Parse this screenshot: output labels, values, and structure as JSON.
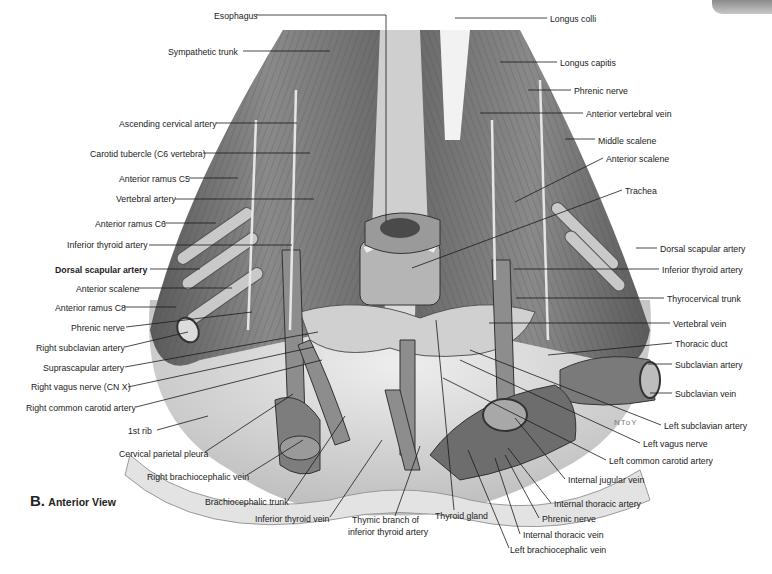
{
  "figure": {
    "panel_letter": "B.",
    "view_title": "Anterior View",
    "artist_signature": "NToY"
  },
  "labels_left": [
    {
      "text": "Esophagus",
      "x": 214,
      "y": 10
    },
    {
      "text": "Sympathetic trunk",
      "x": 168,
      "y": 46
    },
    {
      "text": "Ascending cervical artery",
      "x": 119,
      "y": 118
    },
    {
      "text": "Carotid tubercle (C6 vertebra)",
      "x": 90,
      "y": 148
    },
    {
      "text": "Anterior ramus C5",
      "x": 119,
      "y": 173
    },
    {
      "text": "Vertebral artery",
      "x": 116,
      "y": 193
    },
    {
      "text": "Anterior ramus C6",
      "x": 95,
      "y": 218
    },
    {
      "text": "Inferior thyroid artery",
      "x": 67,
      "y": 239
    },
    {
      "text": "Dorsal scapular artery",
      "x": 55,
      "y": 264,
      "bold": true
    },
    {
      "text": "Anterior scalene",
      "x": 76,
      "y": 283
    },
    {
      "text": "Anterior ramus C8",
      "x": 55,
      "y": 302
    },
    {
      "text": "Phrenic nerve",
      "x": 71,
      "y": 322
    },
    {
      "text": "Right subclavian artery",
      "x": 36,
      "y": 342
    },
    {
      "text": "Suprascapular artery",
      "x": 43,
      "y": 362
    },
    {
      "text": "Right vagus nerve (CN X)",
      "x": 31,
      "y": 381
    },
    {
      "text": "Right common carotid artery",
      "x": 26,
      "y": 402
    },
    {
      "text": "1st rib",
      "x": 128,
      "y": 425
    },
    {
      "text": "Cervical parietal pleura",
      "x": 119,
      "y": 448
    },
    {
      "text": "Right brachiocephalic vein",
      "x": 147,
      "y": 471
    },
    {
      "text": "Brachiocephalic trunk",
      "x": 205,
      "y": 496
    }
  ],
  "labels_bottom": [
    {
      "text": "Inferior thyroid vein",
      "x": 255,
      "y": 513
    },
    {
      "text": "Thymic branch of",
      "x": 352,
      "y": 514
    },
    {
      "text": "inferior thyroid artery",
      "x": 348,
      "y": 526
    },
    {
      "text": "Thyroid gland",
      "x": 435,
      "y": 510
    }
  ],
  "labels_right": [
    {
      "text": "Longus colli",
      "x": 550,
      "y": 13
    },
    {
      "text": "Longus capitis",
      "x": 560,
      "y": 57
    },
    {
      "text": "Phrenic nerve",
      "x": 574,
      "y": 85
    },
    {
      "text": "Anterior vertebral vein",
      "x": 586,
      "y": 108
    },
    {
      "text": "Middle scalene",
      "x": 598,
      "y": 135
    },
    {
      "text": "Anterior scalene",
      "x": 606,
      "y": 153
    },
    {
      "text": "Trachea",
      "x": 625,
      "y": 185
    },
    {
      "text": "Dorsal scapular artery",
      "x": 660,
      "y": 243
    },
    {
      "text": "Inferior thyroid artery",
      "x": 662,
      "y": 264
    },
    {
      "text": "Thyrocervical trunk",
      "x": 667,
      "y": 293
    },
    {
      "text": "Vertebral vein",
      "x": 673,
      "y": 318
    },
    {
      "text": "Thoracic duct",
      "x": 675,
      "y": 338
    },
    {
      "text": "Subclavian artery",
      "x": 675,
      "y": 359
    },
    {
      "text": "Subclavian vein",
      "x": 675,
      "y": 388
    },
    {
      "text": "Left subclavian artery",
      "x": 664,
      "y": 420
    },
    {
      "text": "Left vagus nerve",
      "x": 643,
      "y": 438
    },
    {
      "text": "Left common carotid artery",
      "x": 609,
      "y": 455
    },
    {
      "text": "Internal jugular vein",
      "x": 568,
      "y": 474
    },
    {
      "text": "Internal thoracic artery",
      "x": 554,
      "y": 498
    },
    {
      "text": "Phrenic nerve",
      "x": 542,
      "y": 513
    },
    {
      "text": "Internal thoracic vein",
      "x": 523,
      "y": 529
    },
    {
      "text": "Left brachiocephalic vein",
      "x": 510,
      "y": 544
    }
  ],
  "colors": {
    "text": "#222222",
    "leader_line": "#1a1a1a",
    "illustration_dark": "#3a3a3a",
    "illustration_mid": "#7a7a7a",
    "illustration_light": "#d8d8d8",
    "background": "#ffffff"
  }
}
